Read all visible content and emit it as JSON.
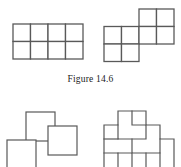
{
  "page": {
    "background_color": "#ffffff",
    "width": 181,
    "height": 167
  },
  "caption": {
    "text": "Figure 14.6",
    "figure_number": "14.6",
    "label_word": "Figure"
  },
  "style": {
    "line_color": "#595959",
    "line_color_dark": "#4a4a4a",
    "line_color_light": "#8a8a8a",
    "stroke_width": 1.3,
    "fill": "#ffffff"
  },
  "figures": {
    "top_left": {
      "name": "rectangle-grid",
      "description": "4 by 2 grid of unit squares forming a rectangle",
      "cols": 4,
      "rows": 2,
      "cell_size": 17.5,
      "origin_x": 13,
      "origin_y": 24,
      "cells": [
        {
          "col": 0,
          "row": 0
        },
        {
          "col": 1,
          "row": 0
        },
        {
          "col": 2,
          "row": 0
        },
        {
          "col": 3,
          "row": 0
        },
        {
          "col": 0,
          "row": 1
        },
        {
          "col": 1,
          "row": 1
        },
        {
          "col": 2,
          "row": 1
        },
        {
          "col": 3,
          "row": 1
        }
      ]
    },
    "top_right": {
      "name": "staircase-polyomino",
      "description": "Eight unit squares arranged as an offset staircase: two stacked squares at left, two wide middle band, two squares raised at upper right",
      "cell_size": 17.5,
      "origin_x": 104,
      "origin_y": 9,
      "cells": [
        {
          "col": 2,
          "row": 0
        },
        {
          "col": 3,
          "row": 0
        },
        {
          "col": 0,
          "row": 1
        },
        {
          "col": 1,
          "row": 1
        },
        {
          "col": 2,
          "row": 1
        },
        {
          "col": 3,
          "row": 1
        },
        {
          "col": 0,
          "row": 2
        },
        {
          "col": 1,
          "row": 2
        }
      ]
    },
    "bottom_left": {
      "name": "overlapping-squares",
      "description": "Three large overlapping outlined squares, partially cropped by the bottom edge",
      "squares": [
        {
          "x": 26,
          "y": 112,
          "size": 29
        },
        {
          "x": 48,
          "y": 126,
          "size": 29
        },
        {
          "x": 7,
          "y": 140,
          "size": 29
        }
      ]
    },
    "bottom_right": {
      "name": "interlocking-tiling",
      "description": "Interlocking jigsaw-like polyomino tiling, partially cropped by the bottom edge",
      "origin_x": 104,
      "origin_y": 111,
      "cell_size": 14
    }
  }
}
